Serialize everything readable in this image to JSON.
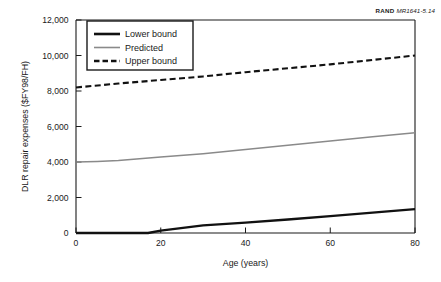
{
  "figure": {
    "credit_word": "RAND",
    "credit_number": "MR1641-5.14"
  },
  "chart_data": {
    "type": "line",
    "title": "",
    "xlabel": "Age (years)",
    "ylabel": "DLR repair expenses ($FY98/FH)",
    "xlim": [
      0,
      80
    ],
    "ylim": [
      0,
      12000
    ],
    "xticks": [
      0,
      20,
      40,
      60,
      80
    ],
    "xtick_labels": [
      "0",
      "20",
      "40",
      "60",
      "80"
    ],
    "yticks": [
      0,
      2000,
      4000,
      6000,
      8000,
      10000,
      12000
    ],
    "ytick_labels": [
      "0",
      "2,000",
      "4,000",
      "6,000",
      "8,000",
      "10,000",
      "12,000"
    ],
    "grid": false,
    "legend_position": "upper-left-inside",
    "series": [
      {
        "name": "Lower bound",
        "style": "solid-thick-black",
        "color": "#111111",
        "x": [
          0,
          5,
          10,
          15,
          17,
          20,
          30,
          40,
          50,
          60,
          70,
          80
        ],
        "values": [
          0,
          0,
          0,
          0,
          0,
          130,
          430,
          580,
          760,
          950,
          1150,
          1350
        ]
      },
      {
        "name": "Predicted",
        "style": "solid-gray",
        "color": "#8a8a8a",
        "x": [
          0,
          5,
          10,
          15,
          20,
          30,
          40,
          50,
          60,
          70,
          80
        ],
        "values": [
          4000,
          4030,
          4080,
          4180,
          4280,
          4470,
          4700,
          4950,
          5180,
          5420,
          5650
        ]
      },
      {
        "name": "Upper bound",
        "style": "dashed-black",
        "color": "#111111",
        "x": [
          0,
          10,
          20,
          30,
          40,
          50,
          60,
          70,
          80
        ],
        "values": [
          8200,
          8420,
          8620,
          8820,
          9060,
          9280,
          9500,
          9750,
          10000
        ]
      }
    ]
  }
}
